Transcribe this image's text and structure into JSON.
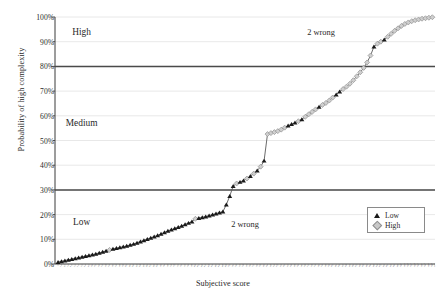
{
  "chart_data": {
    "type": "line",
    "title": "",
    "xlabel": "Subjective score",
    "ylabel": "Probability of high complexity",
    "ylim": [
      0,
      1
    ],
    "ytick_labels": [
      "0%",
      "10%",
      "20%",
      "30%",
      "40%",
      "50%",
      "60%",
      "70%",
      "80%",
      "90%",
      "100%"
    ],
    "ytick_values": [
      0,
      10,
      20,
      30,
      40,
      50,
      60,
      70,
      80,
      90,
      100
    ],
    "grid": "horizontal",
    "legend_position": "bottom-right",
    "legend": [
      {
        "label": "Low",
        "marker": "triangle",
        "color": "#1a1a1a"
      },
      {
        "label": "High",
        "marker": "diamond",
        "color": "#c9c9c9"
      }
    ],
    "threshold_lines": [
      {
        "value": 30,
        "label": "",
        "color": "#4a4a4a"
      },
      {
        "value": 80,
        "label": "",
        "color": "#4a4a4a"
      }
    ],
    "zone_labels": [
      {
        "text": "High",
        "x_frac": 0.07,
        "y_value": 94
      },
      {
        "text": "Medium",
        "x_frac": 0.07,
        "y_value": 57
      },
      {
        "text": "Low",
        "x_frac": 0.07,
        "y_value": 17
      }
    ],
    "annotations": [
      {
        "text": "2 wrong",
        "x_frac": 0.5,
        "y_value": 16
      },
      {
        "text": "2 wrong",
        "x_frac": 0.7,
        "y_value": 94
      }
    ],
    "x_tick_labels": [
      "1",
      "2",
      "3",
      "4",
      "5",
      "6",
      "7",
      "8",
      "9",
      "10",
      "11",
      "12",
      "13",
      "14",
      "15",
      "16",
      "17",
      "18",
      "19",
      "20",
      "21",
      "22",
      "23",
      "24",
      "25",
      "26",
      "27",
      "28",
      "29",
      "30",
      "31",
      "32",
      "33",
      "34",
      "35",
      "36",
      "37",
      "38",
      "39",
      "40",
      "41",
      "42",
      "43",
      "44",
      "45",
      "46",
      "47",
      "48",
      "49",
      "50",
      "51",
      "52",
      "53",
      "54",
      "55",
      "56",
      "57",
      "58",
      "59",
      "60",
      "61",
      "62",
      "63",
      "64",
      "65",
      "66",
      "67",
      "68",
      "69",
      "70",
      "71",
      "72",
      "73",
      "74",
      "75",
      "76",
      "77",
      "78",
      "79",
      "80",
      "81",
      "82",
      "83",
      "84",
      "85",
      "86",
      "87",
      "88",
      "89",
      "90",
      "91",
      "92",
      "93",
      "94",
      "95",
      "96",
      "97",
      "98",
      "99",
      "100",
      "101",
      "102",
      "103",
      "104",
      "105",
      "106",
      "107",
      "108",
      "109",
      "110"
    ],
    "points": [
      {
        "i": 0,
        "y": 0.8,
        "group": "Low"
      },
      {
        "i": 1,
        "y": 1.1,
        "group": "Low"
      },
      {
        "i": 2,
        "y": 1.4,
        "group": "Low"
      },
      {
        "i": 3,
        "y": 1.7,
        "group": "Low"
      },
      {
        "i": 4,
        "y": 2.0,
        "group": "Low"
      },
      {
        "i": 5,
        "y": 2.3,
        "group": "Low"
      },
      {
        "i": 6,
        "y": 2.6,
        "group": "Low"
      },
      {
        "i": 7,
        "y": 2.9,
        "group": "Low"
      },
      {
        "i": 8,
        "y": 3.2,
        "group": "Low"
      },
      {
        "i": 9,
        "y": 3.5,
        "group": "Low"
      },
      {
        "i": 10,
        "y": 3.8,
        "group": "Low"
      },
      {
        "i": 11,
        "y": 4.1,
        "group": "Low"
      },
      {
        "i": 12,
        "y": 4.5,
        "group": "Low"
      },
      {
        "i": 13,
        "y": 4.9,
        "group": "Low"
      },
      {
        "i": 14,
        "y": 5.3,
        "group": "Low"
      },
      {
        "i": 15,
        "y": 5.7,
        "group": "High"
      },
      {
        "i": 16,
        "y": 6.1,
        "group": "Low"
      },
      {
        "i": 17,
        "y": 6.4,
        "group": "Low"
      },
      {
        "i": 18,
        "y": 6.7,
        "group": "Low"
      },
      {
        "i": 19,
        "y": 7.0,
        "group": "Low"
      },
      {
        "i": 20,
        "y": 7.3,
        "group": "Low"
      },
      {
        "i": 21,
        "y": 7.7,
        "group": "Low"
      },
      {
        "i": 22,
        "y": 8.1,
        "group": "Low"
      },
      {
        "i": 23,
        "y": 8.6,
        "group": "Low"
      },
      {
        "i": 24,
        "y": 9.1,
        "group": "Low"
      },
      {
        "i": 25,
        "y": 9.6,
        "group": "Low"
      },
      {
        "i": 26,
        "y": 10.1,
        "group": "Low"
      },
      {
        "i": 27,
        "y": 10.6,
        "group": "Low"
      },
      {
        "i": 28,
        "y": 11.1,
        "group": "Low"
      },
      {
        "i": 29,
        "y": 11.6,
        "group": "Low"
      },
      {
        "i": 30,
        "y": 12.2,
        "group": "Low"
      },
      {
        "i": 31,
        "y": 12.8,
        "group": "Low"
      },
      {
        "i": 32,
        "y": 13.4,
        "group": "Low"
      },
      {
        "i": 33,
        "y": 13.9,
        "group": "Low"
      },
      {
        "i": 34,
        "y": 14.4,
        "group": "Low"
      },
      {
        "i": 35,
        "y": 14.9,
        "group": "Low"
      },
      {
        "i": 36,
        "y": 15.4,
        "group": "Low"
      },
      {
        "i": 37,
        "y": 16.0,
        "group": "Low"
      },
      {
        "i": 38,
        "y": 16.6,
        "group": "Low"
      },
      {
        "i": 39,
        "y": 17.2,
        "group": "Low"
      },
      {
        "i": 40,
        "y": 18.3,
        "group": "High"
      },
      {
        "i": 41,
        "y": 18.6,
        "group": "Low"
      },
      {
        "i": 42,
        "y": 18.9,
        "group": "Low"
      },
      {
        "i": 43,
        "y": 19.2,
        "group": "Low"
      },
      {
        "i": 44,
        "y": 19.6,
        "group": "Low"
      },
      {
        "i": 45,
        "y": 20.0,
        "group": "Low"
      },
      {
        "i": 46,
        "y": 20.4,
        "group": "Low"
      },
      {
        "i": 47,
        "y": 20.8,
        "group": "Low"
      },
      {
        "i": 48,
        "y": 21.2,
        "group": "Low"
      },
      {
        "i": 49,
        "y": 24.0,
        "group": "Low"
      },
      {
        "i": 50,
        "y": 27.5,
        "group": "Low"
      },
      {
        "i": 51,
        "y": 31.5,
        "group": "Low"
      },
      {
        "i": 52,
        "y": 32.6,
        "group": "High"
      },
      {
        "i": 53,
        "y": 33.2,
        "group": "Low"
      },
      {
        "i": 54,
        "y": 33.8,
        "group": "Low"
      },
      {
        "i": 55,
        "y": 34.6,
        "group": "High"
      },
      {
        "i": 56,
        "y": 35.6,
        "group": "Low"
      },
      {
        "i": 57,
        "y": 36.6,
        "group": "High"
      },
      {
        "i": 58,
        "y": 37.8,
        "group": "Low"
      },
      {
        "i": 59,
        "y": 39.4,
        "group": "High"
      },
      {
        "i": 60,
        "y": 41.8,
        "group": "Low"
      },
      {
        "i": 61,
        "y": 52.6,
        "group": "High"
      },
      {
        "i": 62,
        "y": 53.0,
        "group": "High"
      },
      {
        "i": 63,
        "y": 53.4,
        "group": "High"
      },
      {
        "i": 64,
        "y": 53.8,
        "group": "High"
      },
      {
        "i": 65,
        "y": 54.4,
        "group": "High"
      },
      {
        "i": 66,
        "y": 55.2,
        "group": "High"
      },
      {
        "i": 67,
        "y": 56.0,
        "group": "Low"
      },
      {
        "i": 68,
        "y": 56.6,
        "group": "Low"
      },
      {
        "i": 69,
        "y": 57.2,
        "group": "Low"
      },
      {
        "i": 70,
        "y": 57.8,
        "group": "High"
      },
      {
        "i": 71,
        "y": 58.6,
        "group": "Low"
      },
      {
        "i": 72,
        "y": 59.6,
        "group": "High"
      },
      {
        "i": 73,
        "y": 60.6,
        "group": "High"
      },
      {
        "i": 74,
        "y": 61.6,
        "group": "High"
      },
      {
        "i": 75,
        "y": 62.6,
        "group": "High"
      },
      {
        "i": 76,
        "y": 63.6,
        "group": "Low"
      },
      {
        "i": 77,
        "y": 64.4,
        "group": "High"
      },
      {
        "i": 78,
        "y": 65.2,
        "group": "High"
      },
      {
        "i": 79,
        "y": 66.2,
        "group": "High"
      },
      {
        "i": 80,
        "y": 67.4,
        "group": "High"
      },
      {
        "i": 81,
        "y": 68.6,
        "group": "Low"
      },
      {
        "i": 82,
        "y": 69.8,
        "group": "Low"
      },
      {
        "i": 83,
        "y": 70.8,
        "group": "High"
      },
      {
        "i": 84,
        "y": 71.8,
        "group": "High"
      },
      {
        "i": 85,
        "y": 73.0,
        "group": "High"
      },
      {
        "i": 86,
        "y": 74.4,
        "group": "High"
      },
      {
        "i": 87,
        "y": 76.0,
        "group": "High"
      },
      {
        "i": 88,
        "y": 77.6,
        "group": "High"
      },
      {
        "i": 89,
        "y": 79.4,
        "group": "High"
      },
      {
        "i": 90,
        "y": 81.6,
        "group": "High"
      },
      {
        "i": 91,
        "y": 84.4,
        "group": "High"
      },
      {
        "i": 92,
        "y": 88.0,
        "group": "Low"
      },
      {
        "i": 93,
        "y": 89.2,
        "group": "High"
      },
      {
        "i": 94,
        "y": 90.0,
        "group": "High"
      },
      {
        "i": 95,
        "y": 90.8,
        "group": "Low"
      },
      {
        "i": 96,
        "y": 92.0,
        "group": "High"
      },
      {
        "i": 97,
        "y": 93.2,
        "group": "High"
      },
      {
        "i": 98,
        "y": 94.4,
        "group": "High"
      },
      {
        "i": 99,
        "y": 95.4,
        "group": "High"
      },
      {
        "i": 100,
        "y": 96.4,
        "group": "High"
      },
      {
        "i": 101,
        "y": 97.2,
        "group": "High"
      },
      {
        "i": 102,
        "y": 97.8,
        "group": "High"
      },
      {
        "i": 103,
        "y": 98.3,
        "group": "High"
      },
      {
        "i": 104,
        "y": 98.7,
        "group": "High"
      },
      {
        "i": 105,
        "y": 99.0,
        "group": "High"
      },
      {
        "i": 106,
        "y": 99.3,
        "group": "High"
      },
      {
        "i": 107,
        "y": 99.5,
        "group": "High"
      },
      {
        "i": 108,
        "y": 99.7,
        "group": "High"
      },
      {
        "i": 109,
        "y": 99.9,
        "group": "High"
      }
    ]
  }
}
